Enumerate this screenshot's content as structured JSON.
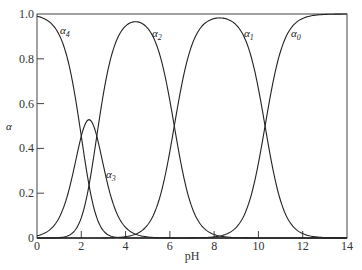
{
  "chart_data": {
    "type": "line",
    "title": "",
    "xlabel": "pH",
    "ylabel": "α",
    "xlim": [
      0,
      14
    ],
    "ylim": [
      0,
      1.0
    ],
    "x_ticks": [
      "0",
      "2",
      "4",
      "6",
      "8",
      "10",
      "12",
      "14"
    ],
    "y_ticks": [
      "0",
      "0.2",
      "0.4",
      "0.6",
      "0.8",
      "1.0"
    ],
    "grid": false,
    "legend": "inline curve labels",
    "pKa": [
      2.0,
      2.7,
      6.2,
      10.3
    ],
    "series": [
      {
        "name": "α4",
        "label_sub": "4",
        "x": [
          0,
          1,
          2,
          3,
          4
        ],
        "values": [
          0.99,
          0.91,
          0.48,
          0.06,
          0.0
        ]
      },
      {
        "name": "α3",
        "label_sub": "3",
        "x": [
          0,
          1,
          2,
          2.35,
          3,
          4,
          5
        ],
        "values": [
          0.01,
          0.09,
          0.44,
          0.51,
          0.33,
          0.05,
          0.0
        ]
      },
      {
        "name": "α2",
        "label_sub": "2",
        "x": [
          1,
          2,
          3,
          4,
          4.45,
          5,
          6,
          7
        ],
        "values": [
          0.0,
          0.08,
          0.61,
          0.95,
          0.97,
          0.96,
          0.61,
          0.14
        ]
      },
      {
        "name": "α1",
        "label_sub": "1",
        "x": [
          5,
          6,
          7,
          8,
          8.25,
          9,
          10,
          11
        ],
        "values": [
          0.06,
          0.39,
          0.86,
          0.99,
          0.99,
          0.95,
          0.67,
          0.17
        ]
      },
      {
        "name": "α0",
        "label_sub": "0",
        "x": [
          9,
          10,
          10.3,
          11,
          12,
          13,
          14
        ],
        "values": [
          0.05,
          0.33,
          0.5,
          0.83,
          0.98,
          1.0,
          1.0
        ]
      }
    ]
  },
  "caption": "Fraction of each EDTA species as a function of pH (distribution diagram)"
}
